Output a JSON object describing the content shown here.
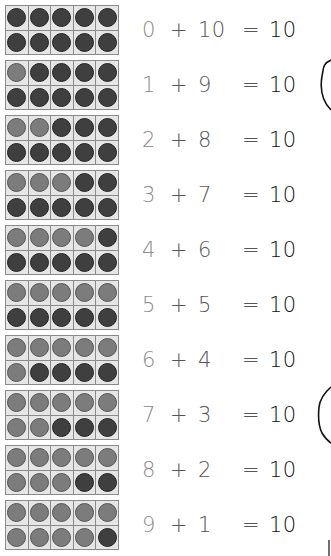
{
  "worksheet": {
    "total": 10,
    "colors": {
      "light_counter": "#7c7c7c",
      "dark_counter": "#3f3f3f",
      "cell_background": "#e6e6e6",
      "grid_line": "#8a8a8a",
      "first_addend_text": "#8a8a8a",
      "operator_text": "#555555",
      "sum_text": "#111111"
    },
    "rows": [
      {
        "a": "0",
        "plus": "+",
        "b": "10",
        "eq": "=",
        "sum": "10",
        "light": 0
      },
      {
        "a": "1",
        "plus": "+",
        "b": "9",
        "eq": "=",
        "sum": "10",
        "light": 1
      },
      {
        "a": "2",
        "plus": "+",
        "b": "8",
        "eq": "=",
        "sum": "10",
        "light": 2
      },
      {
        "a": "3",
        "plus": "+",
        "b": "7",
        "eq": "=",
        "sum": "10",
        "light": 3
      },
      {
        "a": "4",
        "plus": "+",
        "b": "6",
        "eq": "=",
        "sum": "10",
        "light": 4
      },
      {
        "a": "5",
        "plus": "+",
        "b": "5",
        "eq": "=",
        "sum": "10",
        "light": 5
      },
      {
        "a": "6",
        "plus": "+",
        "b": "4",
        "eq": "=",
        "sum": "10",
        "light": 6
      },
      {
        "a": "7",
        "plus": "+",
        "b": "3",
        "eq": "=",
        "sum": "10",
        "light": 7
      },
      {
        "a": "8",
        "plus": "+",
        "b": "2",
        "eq": "=",
        "sum": "10",
        "light": 8
      },
      {
        "a": "9",
        "plus": "+",
        "b": "1",
        "eq": "=",
        "sum": "10",
        "light": 9
      }
    ],
    "hand_marks": [
      {
        "name": "hand-drawn-arc-top",
        "top": 58
      },
      {
        "name": "hand-drawn-arc-bottom",
        "top": 385
      }
    ]
  }
}
